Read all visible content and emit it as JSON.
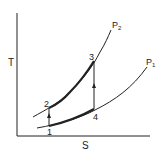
{
  "diagram": {
    "type": "T-S diagram",
    "axes": {
      "y_label": "T",
      "x_label": "S"
    },
    "isobars": [
      {
        "id": "P2",
        "label_main": "P",
        "label_sub": "2"
      },
      {
        "id": "P1",
        "label_main": "P",
        "label_sub": "1"
      }
    ],
    "points": [
      {
        "id": "1",
        "label": "1"
      },
      {
        "id": "2",
        "label": "2"
      },
      {
        "id": "3",
        "label": "3"
      },
      {
        "id": "4",
        "label": "4"
      }
    ],
    "processes": [
      {
        "from": "1",
        "to": "2",
        "kind": "vertical, arrow up"
      },
      {
        "from": "2",
        "to": "3",
        "kind": "along P2 (heavy)"
      },
      {
        "from": "4",
        "to": "3",
        "kind": "vertical, arrow up"
      },
      {
        "from": "1",
        "to": "4",
        "kind": "along P1 (heavy)"
      }
    ],
    "colors": {
      "line": "#222222",
      "background": "#ffffff"
    }
  }
}
